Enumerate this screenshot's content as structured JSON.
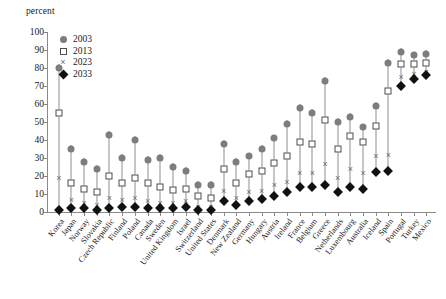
{
  "chart_data": {
    "type": "scatter",
    "title": "",
    "ylabel": "percent",
    "xlabel": "",
    "ylim": [
      0,
      100
    ],
    "ytick_step": 10,
    "yticks": [
      0,
      10,
      20,
      30,
      40,
      50,
      60,
      70,
      80,
      90,
      100
    ],
    "grid": false,
    "legend_position": "top-left",
    "legend": [
      "2003",
      "2013",
      "2023",
      "2033"
    ],
    "categories": [
      "Korea",
      "Japan",
      "Norway",
      "Slovakia",
      "Czech Republic",
      "Finland",
      "Poland",
      "Canada",
      "Sweden",
      "United Kingdom",
      "Israel",
      "Switzerland",
      "United States",
      "Denmark",
      "New Zealand",
      "Germany",
      "Hungary",
      "Austria",
      "Ireland",
      "France",
      "Belgium",
      "Greece",
      "Netherlands",
      "Luxembourg",
      "Australia",
      "Iceland",
      "Spain",
      "Portugal",
      "Turkey",
      "Mexico"
    ],
    "series": [
      {
        "name": "2003",
        "marker": "circle",
        "color": "#7d7d7d",
        "values": [
          82,
          37,
          30,
          26,
          45,
          32,
          42,
          31,
          32,
          27,
          25,
          17,
          17,
          40,
          30,
          33,
          37,
          43,
          51,
          60,
          57,
          75,
          52,
          55,
          49,
          61,
          85,
          91,
          89,
          90
        ]
      },
      {
        "name": "2013",
        "marker": "square",
        "color": "#ffffff",
        "values": [
          57,
          18,
          15,
          13,
          22,
          18,
          21,
          18,
          16,
          14,
          15,
          11,
          10,
          26,
          18,
          23,
          25,
          29,
          33,
          41,
          40,
          53,
          37,
          44,
          41,
          50,
          69,
          84,
          84,
          85
        ]
      },
      {
        "name": "2023",
        "marker": "x",
        "color": "#6b6b6b",
        "values": [
          22,
          10,
          8,
          7,
          11,
          10,
          11,
          9,
          8,
          8,
          9,
          6,
          6,
          15,
          11,
          14,
          15,
          18,
          20,
          25,
          25,
          30,
          22,
          27,
          25,
          34,
          35,
          78,
          80,
          81
        ]
      },
      {
        "name": "2033",
        "marker": "diamond",
        "color": "#111111",
        "values": [
          3,
          4,
          4,
          3,
          4,
          5,
          5,
          4,
          4,
          4,
          5,
          3,
          3,
          8,
          6,
          8,
          9,
          11,
          13,
          16,
          16,
          17,
          13,
          16,
          15,
          24,
          25,
          72,
          76,
          78
        ]
      }
    ]
  }
}
